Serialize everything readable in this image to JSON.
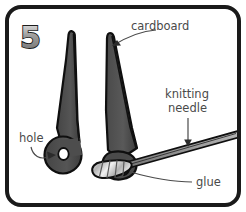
{
  "figure": {
    "step_number": "5",
    "frame_color": "#1a1a1a",
    "background_color": "#ffffff",
    "cardboard_fill": "#4d4d4d",
    "cardboard_outline": "#111111",
    "needle_fill": "#9a9a9a",
    "glue_fill": "#d8d8d8",
    "label_color": "#4a4a4a"
  },
  "labels": {
    "cardboard": "cardboard",
    "knitting_line1": "knitting",
    "knitting_line2": "needle",
    "hole": "hole",
    "glue": "glue"
  }
}
